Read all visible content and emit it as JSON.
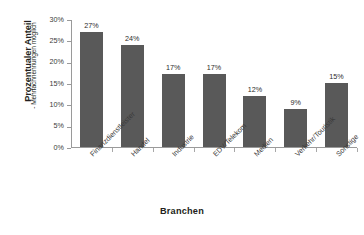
{
  "chart_data": {
    "type": "bar",
    "title": "",
    "subtitle": "",
    "xlabel": "Branchen",
    "ylabel": "Prozentualer Anteil",
    "ylabel_note": "- Mehrfachnennungen möglich",
    "categories": [
      "Finanzdienstleister",
      "Handel",
      "Industrie",
      "EDV/Telekom",
      "Medien",
      "Verkehr/Touristik",
      "Sonstige"
    ],
    "values": [
      27,
      24,
      17,
      17,
      12,
      9,
      15
    ],
    "value_labels": [
      "27%",
      "24%",
      "17%",
      "17%",
      "12%",
      "9%",
      "15%"
    ],
    "ylim": [
      0,
      30
    ],
    "ytick_values": [
      30,
      25,
      20,
      15,
      10,
      5,
      0
    ],
    "ytick_labels": [
      "30%",
      "25%",
      "20%",
      "15%",
      "10%",
      "5%",
      "0%"
    ],
    "grid": false,
    "legend": false,
    "legend_position": "none",
    "bar_color": "#595959",
    "axis_color": "#9a9a9a",
    "background_color": "#ffffff",
    "text_color": "#231f20"
  }
}
